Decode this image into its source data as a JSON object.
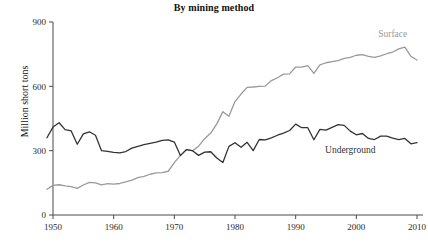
{
  "chart_data": {
    "type": "line",
    "title": "By mining method",
    "xlabel": "",
    "ylabel": "Million short tons",
    "xlim": [
      1949,
      2011
    ],
    "ylim": [
      0,
      900
    ],
    "grid": false,
    "legend_position": "inline-annotation",
    "xticks": [
      1950,
      1960,
      1970,
      1980,
      1990,
      2000,
      2010
    ],
    "xtick_labels": [
      "1950",
      "1960",
      "1970",
      "1980",
      "1990",
      "2000",
      "2010"
    ],
    "yticks": [
      0,
      300,
      600,
      900
    ],
    "ytick_labels": [
      "0",
      "300",
      "600",
      "900"
    ],
    "series": [
      {
        "name": "Surface",
        "color": "#9a9a9a",
        "label_x": 2006,
        "label_y": 830,
        "x": [
          1949,
          1950,
          1951,
          1952,
          1953,
          1954,
          1955,
          1956,
          1957,
          1958,
          1959,
          1960,
          1961,
          1962,
          1963,
          1964,
          1965,
          1966,
          1967,
          1968,
          1969,
          1970,
          1971,
          1972,
          1973,
          1974,
          1975,
          1976,
          1977,
          1978,
          1979,
          1980,
          1981,
          1982,
          1983,
          1984,
          1985,
          1986,
          1987,
          1988,
          1989,
          1990,
          1991,
          1992,
          1993,
          1994,
          1995,
          1996,
          1997,
          1998,
          1999,
          2000,
          2001,
          2002,
          2003,
          2004,
          2005,
          2006,
          2007,
          2008,
          2009,
          2010
        ],
        "values": [
          120,
          138,
          141,
          136,
          132,
          124,
          140,
          152,
          150,
          140,
          146,
          144,
          147,
          154,
          163,
          174,
          180,
          190,
          196,
          198,
          204,
          244,
          278,
          305,
          299,
          321,
          356,
          382,
          425,
          482,
          460,
          529,
          564,
          595,
          597,
          600,
          601,
          627,
          640,
          657,
          658,
          690,
          690,
          697,
          660,
          700,
          710,
          715,
          720,
          730,
          735,
          745,
          748,
          740,
          735,
          742,
          752,
          760,
          775,
          783,
          740,
          723
        ]
      },
      {
        "name": "Underground",
        "color": "#333333",
        "label_x": 1999,
        "label_y": 290,
        "x": [
          1949,
          1950,
          1951,
          1952,
          1953,
          1954,
          1955,
          1956,
          1957,
          1958,
          1959,
          1960,
          1961,
          1962,
          1963,
          1964,
          1965,
          1966,
          1967,
          1968,
          1969,
          1970,
          1971,
          1972,
          1973,
          1974,
          1975,
          1976,
          1977,
          1978,
          1979,
          1980,
          1981,
          1982,
          1983,
          1984,
          1985,
          1986,
          1987,
          1988,
          1989,
          1990,
          1991,
          1992,
          1993,
          1994,
          1995,
          1996,
          1997,
          1998,
          1999,
          2000,
          2001,
          2002,
          2003,
          2004,
          2005,
          2006,
          2007,
          2008,
          2009,
          2010
        ],
        "values": [
          360,
          410,
          430,
          398,
          392,
          330,
          378,
          388,
          372,
          300,
          297,
          292,
          290,
          296,
          312,
          320,
          328,
          334,
          340,
          348,
          350,
          340,
          277,
          305,
          300,
          278,
          293,
          295,
          266,
          245,
          320,
          337,
          316,
          339,
          300,
          352,
          350,
          360,
          372,
          382,
          394,
          424,
          407,
          407,
          351,
          399,
          396,
          409,
          421,
          418,
          391,
          374,
          380,
          357,
          352,
          368,
          368,
          359,
          352,
          357,
          332,
          337
        ]
      }
    ]
  },
  "axis_title": {
    "y": "Million short tons"
  }
}
